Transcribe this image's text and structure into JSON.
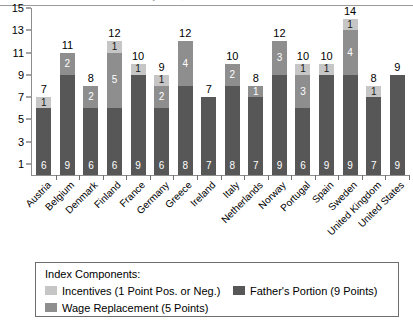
{
  "title": {
    "text": "Parental Leave Policy Index, 2005",
    "cropped": true
  },
  "chart_data": {
    "type": "bar",
    "subtype": "stacked",
    "title": "Parental Leave Policy Index, 2005",
    "xlabel": "",
    "ylabel": "",
    "ylim": [
      0,
      15
    ],
    "ytick_labels": [
      "1",
      "3",
      "5",
      "7",
      "9",
      "11",
      "13",
      "15"
    ],
    "ytick_values": [
      1,
      3,
      5,
      7,
      9,
      11,
      13,
      15
    ],
    "grid": false,
    "legend_position": "bottom",
    "categories": [
      "Austria",
      "Belgium",
      "Denmark",
      "Finland",
      "France",
      "Germany",
      "Greece",
      "Ireland",
      "Italy",
      "Netherlands",
      "Norway",
      "Portugal",
      "Spain",
      "Sweden",
      "United Kingdom",
      "United States"
    ],
    "series": [
      {
        "name": "Father's Portion (9 Points)",
        "key": "father",
        "color": "#575757",
        "values": [
          6,
          9,
          6,
          6,
          9,
          6,
          8,
          7,
          8,
          7,
          9,
          6,
          9,
          9,
          7,
          9
        ]
      },
      {
        "name": "Wage Replacement (5 Points)",
        "key": "wage",
        "color": "#8e8e8e",
        "values": [
          0,
          2,
          2,
          5,
          0,
          2,
          4,
          0,
          2,
          1,
          3,
          3,
          0,
          4,
          0,
          0
        ]
      },
      {
        "name": "Incentives (1 Point Pos. or Neg.)",
        "key": "incentives",
        "color": "#c6c6c6",
        "values": [
          1,
          0,
          0,
          1,
          1,
          1,
          0,
          0,
          0,
          0,
          0,
          1,
          1,
          1,
          1,
          0
        ]
      }
    ],
    "totals": [
      7,
      11,
      8,
      12,
      10,
      9,
      12,
      7,
      10,
      8,
      12,
      10,
      10,
      14,
      8,
      9
    ]
  },
  "legend": {
    "title": "Index Components:",
    "entries": [
      {
        "label": "Incentives (1 Point Pos. or Neg.)",
        "color": "#c6c6c6"
      },
      {
        "label": "Father's Portion (9 Points)",
        "color": "#575757"
      },
      {
        "label": "Wage Replacement (5 Points)",
        "color": "#8e8e8e"
      }
    ]
  }
}
